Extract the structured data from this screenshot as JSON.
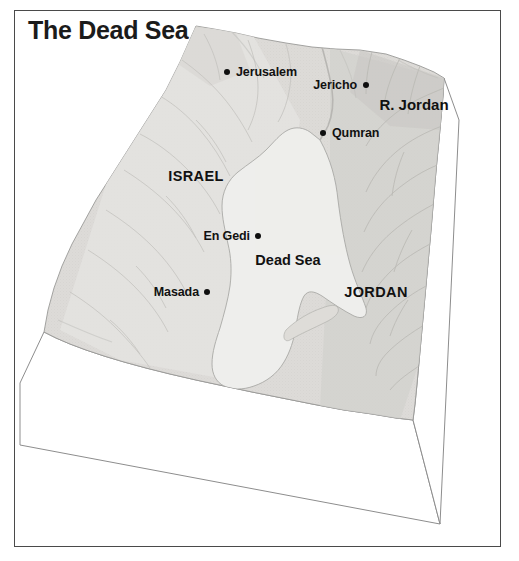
{
  "title": "The Dead Sea",
  "map": {
    "type": "3d-block-relief-map",
    "water_body_name": "Dead Sea",
    "colors": {
      "frame_border": "#4a4a4a",
      "background": "#ffffff",
      "land_light": "#e3e3e1",
      "land_mid": "#d7d7d4",
      "land_shadow": "#c9c9c6",
      "water": "#eeeeec",
      "block_side": "#ffffff",
      "block_edge": "#8d8d8d",
      "label_text": "#111111",
      "title_text": "#1b1b1b"
    },
    "cities": [
      {
        "name": "Jerusalem",
        "dot_x": 227,
        "dot_y": 72,
        "label_x": 236,
        "label_y": 72,
        "align": "left"
      },
      {
        "name": "Jericho",
        "dot_x": 366,
        "dot_y": 85,
        "label_x": 357,
        "label_y": 85,
        "align": "right"
      },
      {
        "name": "Qumran",
        "dot_x": 323,
        "dot_y": 133,
        "label_x": 332,
        "label_y": 133,
        "align": "left"
      },
      {
        "name": "En Gedi",
        "dot_x": 258,
        "dot_y": 236,
        "label_x": 249,
        "label_y": 236,
        "align": "right"
      },
      {
        "name": "Masada",
        "dot_x": 207,
        "dot_y": 292,
        "label_x": 198,
        "label_y": 292,
        "align": "right"
      }
    ],
    "regions": [
      {
        "name": "ISRAEL",
        "label_x": 196,
        "label_y": 176
      },
      {
        "name": "JORDAN",
        "label_x": 376,
        "label_y": 292
      }
    ],
    "features": [
      {
        "name": "R. Jordan",
        "kind": "river",
        "label_x": 414,
        "label_y": 104
      },
      {
        "name": "Dead Sea",
        "kind": "water-body",
        "label_x": 288,
        "label_y": 260
      }
    ]
  }
}
